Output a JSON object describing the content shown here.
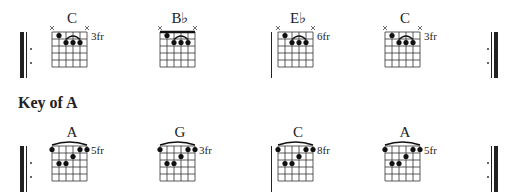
{
  "sections": [
    {
      "heading": "",
      "chords": [
        {
          "name": "C",
          "fret_label": "3fr",
          "shape": "top"
        },
        {
          "name": "B♭",
          "fret_label": "",
          "shape": "top"
        },
        {
          "name": "E♭",
          "fret_label": "6fr",
          "shape": "top"
        },
        {
          "name": "C",
          "fret_label": "3fr",
          "shape": "top"
        }
      ]
    },
    {
      "heading": "Key of A",
      "chords": [
        {
          "name": "A",
          "fret_label": "5fr",
          "shape": "bottom"
        },
        {
          "name": "G",
          "fret_label": "3fr",
          "shape": "bottom"
        },
        {
          "name": "C",
          "fret_label": "8fr",
          "shape": "bottom"
        },
        {
          "name": "A",
          "fret_label": "5fr",
          "shape": "bottom"
        }
      ]
    }
  ],
  "shapes": {
    "top": {
      "muted_strings": [
        1,
        6
      ],
      "dots": [
        [
          2,
          1
        ],
        [
          3,
          2
        ],
        [
          4,
          2
        ],
        [
          5,
          2
        ]
      ],
      "arc_strings": [
        3,
        5
      ],
      "nut": false
    },
    "bottom": {
      "muted_strings": [],
      "dots": [
        [
          1,
          1
        ],
        [
          5,
          1
        ],
        [
          6,
          1
        ],
        [
          4,
          2
        ],
        [
          2,
          3
        ],
        [
          3,
          3
        ]
      ],
      "arc_strings": [
        1,
        6
      ],
      "nut": false
    }
  },
  "nut_chords": [
    "B♭"
  ]
}
